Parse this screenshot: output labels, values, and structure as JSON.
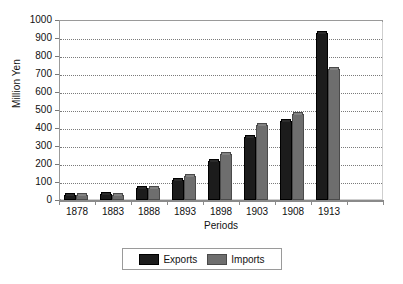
{
  "chart_data": {
    "type": "bar",
    "title": "",
    "xlabel": "Periods",
    "ylabel": "Million Yen",
    "categories": [
      "1878",
      "1883",
      "1888",
      "1893",
      "1898",
      "1903",
      "1908",
      "1913"
    ],
    "series": [
      {
        "name": "Exports",
        "color": "#1c1c1c",
        "values": [
          27,
          36,
          65,
          110,
          215,
          350,
          440,
          930
        ]
      },
      {
        "name": "Imports",
        "color": "#6e6e6e",
        "values": [
          30,
          29,
          68,
          135,
          255,
          415,
          480,
          730
        ]
      }
    ],
    "ylim": [
      0,
      1000
    ],
    "y_ticks": [
      0,
      100,
      200,
      300,
      400,
      500,
      600,
      700,
      800,
      900,
      1000
    ],
    "y_tick_labels": [
      "0",
      "100",
      "200",
      "300",
      "400",
      "500",
      "600",
      "700",
      "800",
      "900",
      "1000"
    ],
    "grid": true,
    "grid_axis": "y",
    "legend_position": "bottom",
    "legend_entries": [
      "Exports",
      "Imports"
    ]
  }
}
